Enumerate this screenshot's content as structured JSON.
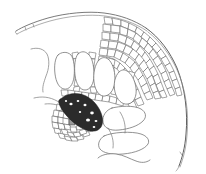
{
  "figure": {
    "caption": "",
    "background_color": "#ffffff",
    "line_color": "#5a5a5a",
    "bundle_color": "#2b2b2b",
    "width": 206,
    "height": 174
  },
  "structures": {
    "upper_epidermis": {
      "name": "upper epidermis",
      "label": "",
      "stroke": "#6b6b6b",
      "path_outer": "M16,31 C22,27 34,22 48,18 C66,13 88,11 104,13 C120,15 134,20 146,28",
      "path_inner": "M17,34 C24,30 36,25 50,21 C68,16 89,14 105,16 C121,18 135,23 147,31"
    },
    "right_margin": {
      "name": "leaf margin",
      "label": "",
      "stroke": "#5e5e5e",
      "path_outer": "M146,28 C160,38 170,52 177,68 C185,88 188,112 186,134 C185,148 182,158 179,166",
      "path_inner": "M148,32 C161,42 171,56 178,72 C186,91 189,113 187,135 C186,149 183,159 180,167"
    },
    "vascular_bundle": {
      "name": "vascular bundle",
      "label": "",
      "fill": "#2b2b2b",
      "description": "dark xylem/phloem core with sclerenchyma sheath"
    },
    "parenchyma_mesh": {
      "name": "parenchyma cell mesh",
      "label": "",
      "description": "polygonal small cells filling upper right region"
    },
    "air_cavities": {
      "name": "air cavities",
      "label": "",
      "description": "finger-like and irregular lacunae"
    }
  },
  "chamber_outlines": [
    "M58,55 C55,58 54,66 55,74 C56,82 59,88 64,89 C69,90 73,85 74,77 C75,68 74,59 71,55 C67,51 61,52 58,55 Z",
    "M78,54 C75,57 74,66 75,75 C76,84 80,90 85,90 C90,90 94,84 94,75 C94,65 92,57 88,54 C85,51 81,51 78,54 Z",
    "M99,60 C95,64 93,73 94,82 C95,91 100,97 105,96 C111,95 115,88 115,79 C115,70 112,62 108,59 C105,57 102,57 99,60 Z",
    "M119,72 C115,76 113,84 115,92 C117,100 122,105 128,104 C134,103 137,96 136,88 C135,80 131,73 127,71 C124,69 121,70 119,72 Z"
  ],
  "lower_cavities": [
    "M112,108 C106,110 102,116 103,122 C104,128 110,131 119,130 C129,129 138,126 143,121 C147,117 146,112 141,109 C134,105 120,106 112,108 Z",
    "M104,136 C99,139 97,145 100,149 C103,153 112,155 123,154 C135,153 145,149 148,144 C150,140 147,136 141,134 C132,131 112,132 104,136 Z",
    "M98,158 C101,155 108,153 116,154 C124,155 130,159 136,161 C141,163 146,163 150,160"
  ],
  "strands": [
    "M31,49 C38,47 44,49 47,54 C50,60 49,69 46,76 C44,82 42,87 43,92",
    "M34,98 C42,96 50,97 57,101 C63,104 68,108 72,112",
    "M45,104 C52,103 60,105 66,109",
    "M108,128 C112,134 114,141 113,148",
    "M120,112 C124,118 126,126 125,133"
  ]
}
